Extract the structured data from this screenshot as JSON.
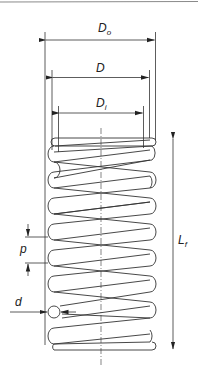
{
  "diagram": {
    "top_rule_color": "#8a8a8a",
    "line_color": "#333333",
    "labels": {
      "outer_diameter": {
        "main": "D",
        "sub": "o"
      },
      "mean_diameter": {
        "main": "D",
        "sub": ""
      },
      "inner_diameter": {
        "main": "D",
        "sub": "i"
      },
      "free_length": {
        "main": "L",
        "sub": "f"
      },
      "pitch": {
        "main": "p",
        "sub": ""
      },
      "wire_diameter": {
        "main": "d",
        "sub": ""
      }
    },
    "coil_count": 9
  }
}
